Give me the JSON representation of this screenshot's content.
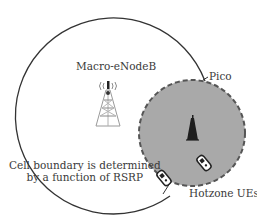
{
  "diagram": {
    "macro": {
      "label": "Macro-eNodeB",
      "icon": "cell-tower-icon"
    },
    "pico": {
      "label": "Pico",
      "icon": "small-cell-tower-icon",
      "fill_color": "#a9a9a9"
    },
    "ues": {
      "label": "Hotzone UEs",
      "icon": "mobile-phone-icon",
      "count": 2
    },
    "boundary_note": {
      "line1": "Cell boundary is determined",
      "line2": "by a function of RSRP"
    }
  }
}
